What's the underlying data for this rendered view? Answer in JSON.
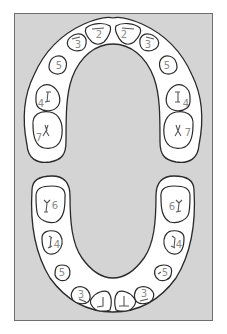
{
  "diagram": {
    "title": "",
    "type": "dental-arch-chart",
    "colors": {
      "background": "#d4d4d4",
      "frame_border": "#6e6e6e",
      "tooth_fill": "#ffffff",
      "tooth_outline": "#2a2a2a",
      "label": "#8a8a8a"
    },
    "upper_arch": {
      "teeth": [
        {
          "id": "upper-left-molar",
          "label": "7"
        },
        {
          "id": "upper-left-premolar-4",
          "label": "4"
        },
        {
          "id": "upper-left-premolar-5",
          "label": "5"
        },
        {
          "id": "upper-left-canine",
          "label": "3"
        },
        {
          "id": "upper-left-incisor",
          "label": "2"
        },
        {
          "id": "upper-right-incisor",
          "label": "2"
        },
        {
          "id": "upper-right-canine",
          "label": "3"
        },
        {
          "id": "upper-right-premolar-5",
          "label": "5"
        },
        {
          "id": "upper-right-premolar-4",
          "label": "4"
        },
        {
          "id": "upper-right-molar",
          "label": "7"
        }
      ]
    },
    "lower_arch": {
      "teeth": [
        {
          "id": "lower-left-molar",
          "label": "6"
        },
        {
          "id": "lower-left-premolar-4",
          "label": "4"
        },
        {
          "id": "lower-left-premolar-5",
          "label": "5"
        },
        {
          "id": "lower-left-canine",
          "label": "3"
        },
        {
          "id": "lower-left-incisor",
          "label": "1"
        },
        {
          "id": "lower-right-incisor",
          "label": "1"
        },
        {
          "id": "lower-right-canine",
          "label": "3"
        },
        {
          "id": "lower-right-premolar-5",
          "label": "5"
        },
        {
          "id": "lower-right-premolar-4",
          "label": "4"
        },
        {
          "id": "lower-right-molar",
          "label": "6"
        }
      ]
    }
  }
}
